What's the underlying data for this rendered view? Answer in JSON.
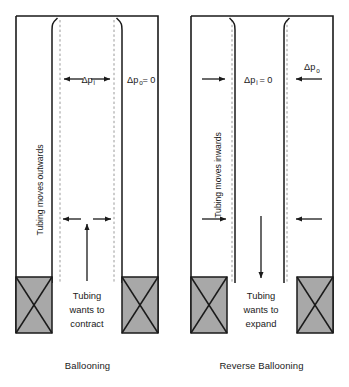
{
  "figure": {
    "type": "engineering-diagram",
    "background_color": "#ffffff",
    "line_color": "#1a1a1a",
    "packer_fill": "#a8a8a8",
    "dashed_color": "#9a9a9a"
  },
  "panels": [
    {
      "id": "ballooning",
      "caption": "Ballooning",
      "wall_curvature": "outward",
      "vertical_label": "Tubing moves outwards",
      "inner_pressure_label": "Δp",
      "inner_pressure_sub": "i",
      "inner_pressure_suffix": "",
      "outer_pressure_label": "Δp",
      "outer_pressure_sub": "o",
      "outer_pressure_suffix": " = 0",
      "upper_arrows": "double-headed-outward-inside-bore",
      "lower_arrows": "outward-pair",
      "axial_arrow_direction": "up",
      "axial_note_lines": [
        "Tubing",
        "wants to",
        "contract"
      ]
    },
    {
      "id": "reverse-ballooning",
      "caption": "Reverse Ballooning",
      "wall_curvature": "inward",
      "vertical_label": "Tubing moves inwards",
      "inner_pressure_label": "Δp",
      "inner_pressure_sub": "i",
      "inner_pressure_suffix": " = 0",
      "outer_pressure_label": "Δp",
      "outer_pressure_sub": "o",
      "outer_pressure_suffix": "",
      "upper_arrows": "inward-pair-toward-bore",
      "lower_arrows": "inward-pair",
      "axial_arrow_direction": "down",
      "axial_note_lines": [
        "Tubing",
        "wants to",
        "expand"
      ]
    }
  ]
}
